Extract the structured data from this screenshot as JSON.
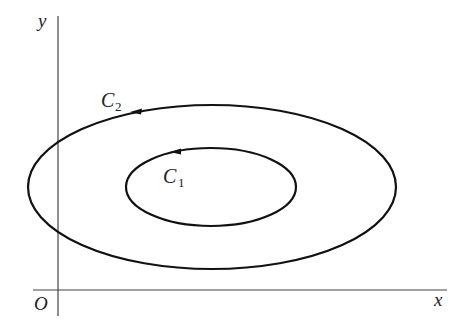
{
  "diagram": {
    "axes": {
      "x_label": "x",
      "y_label": "y",
      "origin_label": "O"
    },
    "curves": [
      {
        "name": "C",
        "subscript": "2",
        "kind": "outer-ellipse",
        "direction": "counterclockwise"
      },
      {
        "name": "C",
        "subscript": "1",
        "kind": "inner-ellipse",
        "direction": "counterclockwise"
      }
    ],
    "colors": {
      "curve": "#111111",
      "axis": "#444444"
    }
  }
}
